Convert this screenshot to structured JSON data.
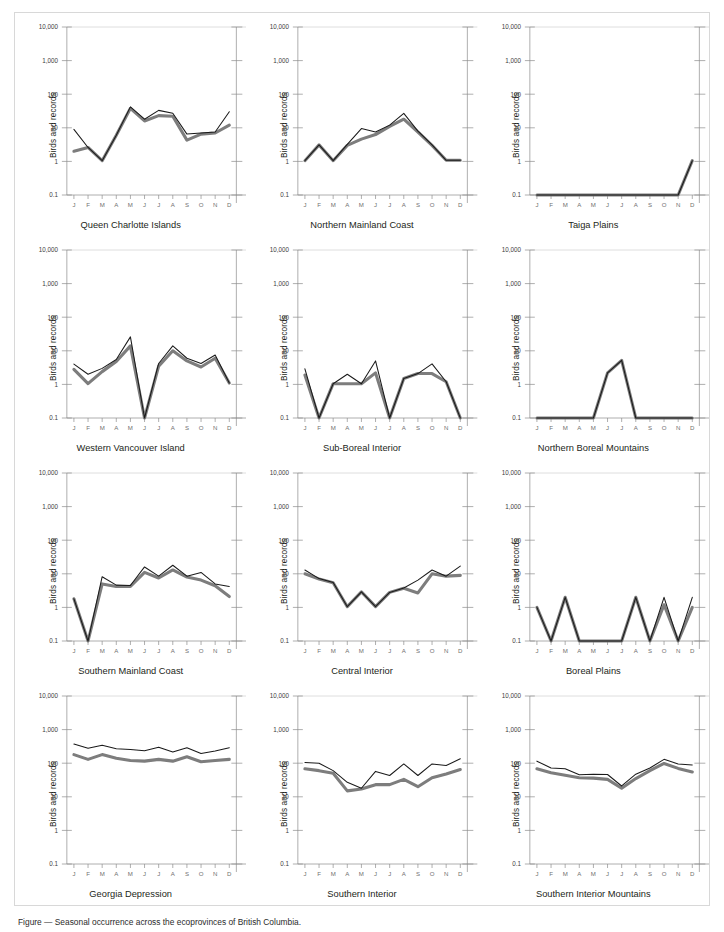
{
  "figure": {
    "ylabel": "Birds and records",
    "y_ticks": [
      "10,000",
      "1,000",
      "100",
      "10",
      "1",
      "0.1"
    ],
    "y_tick_values": [
      10000,
      1000,
      100,
      10,
      1,
      0.1
    ],
    "x_ticks": [
      "J",
      "F",
      "M",
      "A",
      "M",
      "J",
      "J",
      "A",
      "S",
      "O",
      "N",
      "D"
    ],
    "colors": {
      "black_series": "#1a1a1a",
      "gray_series": "#7d7d7d",
      "axis": "#8c8c8c",
      "grid": "#cfcfcf",
      "border": "#d8d8d8"
    },
    "footnote": "Figure — Seasonal occurrence across the ecoprovinces of British Columbia."
  },
  "chart_data": [
    {
      "type": "line",
      "title": "Queen Charlotte Islands",
      "xlabel": "",
      "ylabel": "Birds and records",
      "categories": [
        "J",
        "F",
        "M",
        "A",
        "M",
        "J",
        "J",
        "A",
        "S",
        "O",
        "N",
        "D"
      ],
      "ylim": [
        0.1,
        10000
      ],
      "yscale": "log",
      "grid": "top-only",
      "legend": "none",
      "series": [
        {
          "name": "records",
          "color": "#1a1a1a",
          "values": [
            9,
            2.6,
            1.05,
            6,
            42,
            18,
            33,
            27,
            6.5,
            7,
            7.5,
            30
          ]
        },
        {
          "name": "birds",
          "color": "#7d7d7d",
          "values": [
            2.0,
            2.6,
            1.05,
            6,
            38,
            16,
            23,
            22,
            4.3,
            6.5,
            7.0,
            12
          ]
        }
      ]
    },
    {
      "type": "line",
      "title": "Northern Mainland Coast",
      "xlabel": "",
      "ylabel": "Birds and records",
      "categories": [
        "J",
        "F",
        "M",
        "A",
        "M",
        "J",
        "J",
        "A",
        "S",
        "O",
        "N",
        "D"
      ],
      "ylim": [
        0.1,
        10000
      ],
      "yscale": "log",
      "grid": "top-only",
      "legend": "none",
      "series": [
        {
          "name": "records",
          "color": "#1a1a1a",
          "values": [
            1.05,
            3.1,
            1.05,
            3.2,
            9.5,
            7.5,
            12,
            27,
            8,
            3.1,
            1.08,
            1.08
          ]
        },
        {
          "name": "birds",
          "color": "#7d7d7d",
          "values": [
            1.05,
            3.1,
            1.05,
            3.0,
            4.6,
            6.3,
            11,
            18,
            7.5,
            3.0,
            1.08,
            1.08
          ]
        }
      ]
    },
    {
      "type": "line",
      "title": "Taiga Plains",
      "xlabel": "",
      "ylabel": "Birds and records",
      "categories": [
        "J",
        "F",
        "M",
        "A",
        "M",
        "J",
        "J",
        "A",
        "S",
        "O",
        "N",
        "D"
      ],
      "ylim": [
        0.1,
        10000
      ],
      "yscale": "log",
      "grid": "top-only",
      "legend": "none",
      "series": [
        {
          "name": "records",
          "color": "#1a1a1a",
          "values": [
            0.1,
            0.1,
            0.1,
            0.1,
            0.1,
            0.1,
            0.1,
            0.1,
            0.1,
            0.1,
            0.1,
            1.05
          ]
        },
        {
          "name": "birds",
          "color": "#7d7d7d",
          "values": [
            0.1,
            0.1,
            0.1,
            0.1,
            0.1,
            0.1,
            0.1,
            0.1,
            0.1,
            0.1,
            0.1,
            1.05
          ]
        }
      ]
    },
    {
      "type": "line",
      "title": "Western Vancouver Island",
      "xlabel": "",
      "ylabel": "Birds and records",
      "categories": [
        "J",
        "F",
        "M",
        "A",
        "M",
        "J",
        "J",
        "A",
        "S",
        "O",
        "N",
        "D"
      ],
      "ylim": [
        0.1,
        10000
      ],
      "yscale": "log",
      "grid": "top-only",
      "legend": "none",
      "series": [
        {
          "name": "records",
          "color": "#1a1a1a",
          "values": [
            4.0,
            2.0,
            3.0,
            5.5,
            26,
            0.1,
            4.2,
            14,
            6.0,
            4.2,
            7.5,
            1.1
          ]
        },
        {
          "name": "birds",
          "color": "#7d7d7d",
          "values": [
            2.8,
            1.05,
            2.4,
            4.8,
            14,
            0.1,
            3.5,
            10,
            5.0,
            3.3,
            6.0,
            1.1
          ]
        }
      ]
    },
    {
      "type": "line",
      "title": "Sub-Boreal Interior",
      "xlabel": "",
      "ylabel": "Birds and records",
      "categories": [
        "J",
        "F",
        "M",
        "A",
        "M",
        "J",
        "J",
        "A",
        "S",
        "O",
        "N",
        "D"
      ],
      "ylim": [
        0.1,
        10000
      ],
      "yscale": "log",
      "grid": "top-only",
      "legend": "none",
      "series": [
        {
          "name": "records",
          "color": "#1a1a1a",
          "values": [
            2.9,
            0.1,
            1.05,
            2.0,
            1.05,
            5.0,
            0.1,
            1.5,
            2.1,
            4.1,
            1.2,
            0.1
          ]
        },
        {
          "name": "birds",
          "color": "#7d7d7d",
          "values": [
            1.9,
            0.1,
            1.05,
            1.05,
            1.05,
            2.2,
            0.1,
            1.5,
            2.1,
            2.1,
            1.2,
            0.1
          ]
        }
      ]
    },
    {
      "type": "line",
      "title": "Northern Boreal Mountains",
      "xlabel": "",
      "ylabel": "Birds and records",
      "categories": [
        "J",
        "F",
        "M",
        "A",
        "M",
        "J",
        "J",
        "A",
        "S",
        "O",
        "N",
        "D"
      ],
      "ylim": [
        0.1,
        10000
      ],
      "yscale": "log",
      "grid": "top-only",
      "legend": "none",
      "series": [
        {
          "name": "records",
          "color": "#1a1a1a",
          "values": [
            0.1,
            0.1,
            0.1,
            0.1,
            0.1,
            2.2,
            5.2,
            0.1,
            0.1,
            0.1,
            0.1,
            0.1
          ]
        },
        {
          "name": "birds",
          "color": "#7d7d7d",
          "values": [
            0.1,
            0.1,
            0.1,
            0.1,
            0.1,
            2.2,
            5.2,
            0.1,
            0.1,
            0.1,
            0.1,
            0.1
          ]
        }
      ]
    },
    {
      "type": "line",
      "title": "Southern Mainland Coast",
      "xlabel": "",
      "ylabel": "Birds and records",
      "categories": [
        "J",
        "F",
        "M",
        "A",
        "M",
        "J",
        "J",
        "A",
        "S",
        "O",
        "N",
        "D"
      ],
      "ylim": [
        0.1,
        10000
      ],
      "yscale": "log",
      "grid": "top-only",
      "legend": "none",
      "series": [
        {
          "name": "records",
          "color": "#1a1a1a",
          "values": [
            1.8,
            0.1,
            8.2,
            4.6,
            4.5,
            16,
            8.5,
            18,
            8.5,
            11,
            5.0,
            4.2
          ]
        },
        {
          "name": "birds",
          "color": "#7d7d7d",
          "values": [
            1.8,
            0.1,
            5.0,
            4.2,
            4.2,
            11,
            7.5,
            13,
            8.0,
            6.5,
            4.4,
            2.1
          ]
        }
      ]
    },
    {
      "type": "line",
      "title": "Central Interior",
      "xlabel": "",
      "ylabel": "Birds and records",
      "categories": [
        "J",
        "F",
        "M",
        "A",
        "M",
        "J",
        "J",
        "A",
        "S",
        "O",
        "N",
        "D"
      ],
      "ylim": [
        0.1,
        10000
      ],
      "yscale": "log",
      "grid": "top-only",
      "legend": "none",
      "series": [
        {
          "name": "records",
          "color": "#1a1a1a",
          "values": [
            13,
            7.2,
            5.5,
            1.05,
            2.9,
            1.05,
            2.8,
            3.8,
            6.5,
            13,
            8.5,
            17
          ]
        },
        {
          "name": "birds",
          "color": "#7d7d7d",
          "values": [
            10,
            7.0,
            5.4,
            1.05,
            2.9,
            1.05,
            2.8,
            3.7,
            2.7,
            10,
            8.5,
            9.0
          ]
        }
      ]
    },
    {
      "type": "line",
      "title": "Boreal Plains",
      "xlabel": "",
      "ylabel": "Birds and records",
      "categories": [
        "J",
        "F",
        "M",
        "A",
        "M",
        "J",
        "J",
        "A",
        "S",
        "O",
        "N",
        "D"
      ],
      "ylim": [
        0.1,
        10000
      ],
      "yscale": "log",
      "grid": "top-only",
      "legend": "none",
      "series": [
        {
          "name": "records",
          "color": "#1a1a1a",
          "values": [
            1.0,
            0.1,
            2.0,
            0.1,
            0.1,
            0.1,
            0.1,
            2.0,
            0.1,
            2.0,
            0.1,
            2.0
          ]
        },
        {
          "name": "birds",
          "color": "#7d7d7d",
          "values": [
            1.0,
            0.1,
            2.0,
            0.1,
            0.1,
            0.1,
            0.1,
            2.0,
            0.1,
            1.2,
            0.1,
            1.0
          ]
        }
      ]
    },
    {
      "type": "line",
      "title": "Georgia Depression",
      "xlabel": "",
      "ylabel": "Birds and records",
      "categories": [
        "J",
        "F",
        "M",
        "A",
        "M",
        "J",
        "J",
        "A",
        "S",
        "O",
        "N",
        "D"
      ],
      "ylim": [
        0.1,
        10000
      ],
      "yscale": "log",
      "grid": "top-only",
      "legend": "none",
      "series": [
        {
          "name": "records",
          "color": "#1a1a1a",
          "values": [
            370,
            280,
            340,
            270,
            255,
            235,
            300,
            215,
            290,
            195,
            230,
            290
          ]
        },
        {
          "name": "birds",
          "color": "#7d7d7d",
          "values": [
            180,
            130,
            180,
            140,
            120,
            115,
            130,
            115,
            155,
            110,
            120,
            130
          ]
        }
      ]
    },
    {
      "type": "line",
      "title": "Southern Interior",
      "xlabel": "",
      "ylabel": "Birds and records",
      "categories": [
        "J",
        "F",
        "M",
        "A",
        "M",
        "J",
        "J",
        "A",
        "S",
        "O",
        "N",
        "D"
      ],
      "ylim": [
        0.1,
        10000
      ],
      "yscale": "log",
      "grid": "top-only",
      "legend": "none",
      "series": [
        {
          "name": "records",
          "color": "#1a1a1a",
          "values": [
            105,
            100,
            60,
            27,
            18,
            57,
            43,
            95,
            43,
            95,
            85,
            135
          ]
        },
        {
          "name": "birds",
          "color": "#7d7d7d",
          "values": [
            68,
            60,
            50,
            15,
            17,
            23,
            23,
            33,
            20,
            37,
            48,
            65
          ]
        }
      ]
    },
    {
      "type": "line",
      "title": "Southern Interior Mountains",
      "xlabel": "",
      "ylabel": "Birds and records",
      "categories": [
        "J",
        "F",
        "M",
        "A",
        "M",
        "J",
        "J",
        "A",
        "S",
        "O",
        "N",
        "D"
      ],
      "ylim": [
        0.1,
        10000
      ],
      "yscale": "log",
      "grid": "top-only",
      "legend": "none",
      "series": [
        {
          "name": "records",
          "color": "#1a1a1a",
          "values": [
            115,
            72,
            68,
            45,
            47,
            46,
            21,
            47,
            72,
            130,
            95,
            88
          ]
        },
        {
          "name": "birds",
          "color": "#7d7d7d",
          "values": [
            68,
            52,
            44,
            37,
            36,
            33,
            18,
            35,
            60,
            98,
            70,
            55
          ]
        }
      ]
    }
  ]
}
